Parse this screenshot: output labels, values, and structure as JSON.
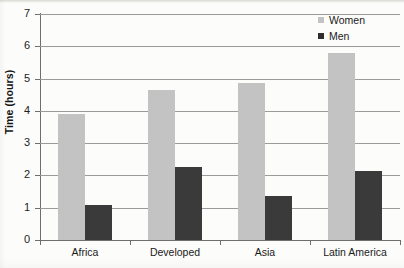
{
  "chart_data": {
    "type": "bar",
    "title": "",
    "subtitle": "",
    "xlabel": "",
    "ylabel": "Time (hours)",
    "categories": [
      "Africa",
      "Developed",
      "Asia",
      "Latin America"
    ],
    "series": [
      {
        "name": "Women",
        "color": "#c3c3c3",
        "values": [
          3.9,
          4.65,
          4.85,
          5.8
        ]
      },
      {
        "name": "Men",
        "color": "#3a3a3a",
        "values": [
          1.1,
          2.25,
          1.35,
          2.15
        ]
      }
    ],
    "ylim": [
      0,
      7
    ],
    "yticks": [
      0,
      1,
      2,
      3,
      4,
      5,
      6,
      7
    ],
    "ytick_labels": [
      "0",
      "1",
      "2",
      "3",
      "4",
      "5",
      "6",
      "7"
    ],
    "grid": true,
    "legend_position": "top-right",
    "legend_entries": [
      "Women",
      "Men"
    ],
    "background_color": "#fcfcfa",
    "axis_color": "#6e6e6e",
    "grid_color": "#9a9a9a"
  }
}
